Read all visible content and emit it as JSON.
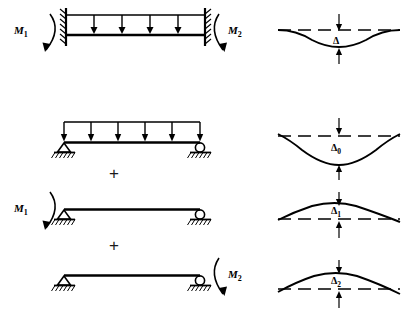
{
  "figure": {
    "type": "structural-beam-diagram",
    "background_color": "#ffffff",
    "line_color": "#000000",
    "rows": [
      {
        "id": "row-1",
        "name": "fixed-fixed-beam-uniform-load",
        "left_support": "fixed",
        "right_support": "fixed",
        "has_distributed_load": true,
        "load_arrow_count": 4,
        "left_moment_label": "M",
        "left_moment_sub": "1",
        "right_moment_label": "M",
        "right_moment_sub": "2",
        "deflection": {
          "label": "Δ",
          "sub": "",
          "direction": "down",
          "magnitude": 12
        }
      },
      {
        "id": "row-2",
        "name": "simply-supported-beam-uniform-load",
        "left_support": "pin",
        "right_support": "roller",
        "has_distributed_load": true,
        "load_arrow_count": 6,
        "left_moment_label": "",
        "left_moment_sub": "",
        "right_moment_label": "",
        "right_moment_sub": "",
        "deflection": {
          "label": "Δ",
          "sub": "0",
          "direction": "down",
          "magnitude": 22
        }
      },
      {
        "id": "row-3",
        "name": "simply-supported-beam-end-moment-m1",
        "left_support": "pin",
        "right_support": "roller",
        "has_distributed_load": false,
        "load_arrow_count": 0,
        "left_moment_label": "M",
        "left_moment_sub": "1",
        "right_moment_label": "",
        "right_moment_sub": "",
        "deflection": {
          "label": "Δ",
          "sub": "1",
          "direction": "up",
          "magnitude": 11
        }
      },
      {
        "id": "row-4",
        "name": "simply-supported-beam-end-moment-m2",
        "left_support": "pin",
        "right_support": "roller",
        "has_distributed_load": false,
        "load_arrow_count": 0,
        "left_moment_label": "",
        "left_moment_sub": "",
        "right_moment_label": "M",
        "right_moment_sub": "2",
        "deflection": {
          "label": "Δ",
          "sub": "2",
          "direction": "up",
          "magnitude": 13
        }
      }
    ],
    "operators": [
      {
        "id": "plus-1",
        "symbol": "+"
      },
      {
        "id": "plus-2",
        "symbol": "+"
      }
    ]
  }
}
